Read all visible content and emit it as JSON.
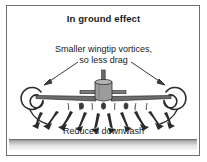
{
  "figure": {
    "title": "In ground effect",
    "annotation_line1": "Smaller wingtip vortices,",
    "annotation_line2": "so less drag",
    "caption": "Reduced downwash",
    "colors": {
      "frame_border": "#6e6e6e",
      "ink": "#1a1a1a",
      "background": "#ffffff",
      "ground_dark": "#9a9a9a",
      "ground_light": "#f4f4f4",
      "aircraft_fill": "#8f8f8f"
    }
  },
  "diagram": {
    "type": "aerodynamics-schematic",
    "elements": [
      "left-wingtip-vortex",
      "right-wingtip-vortex",
      "aircraft-front-view",
      "downwash-arrows",
      "ground-plane"
    ],
    "vortices": {
      "count": 2,
      "left_center_x": 33,
      "right_center_x": 174,
      "center_y": 97,
      "radius": 11,
      "description": "small tight spirals indicating reduced vortex strength"
    },
    "aircraft": {
      "center_x": 103,
      "wing_y": 98,
      "wing_half_span": 72,
      "tail_height": 28
    },
    "downwash": {
      "arrow_count": 10,
      "direction": "downward and outward",
      "streak_count": 7
    }
  }
}
